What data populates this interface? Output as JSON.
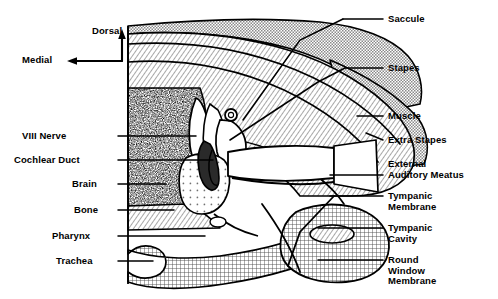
{
  "figure": {
    "background_color": "#ffffff",
    "ink_color": "#000000",
    "width": 498,
    "height": 299
  },
  "orientation": {
    "dorsal_label": "Dorsal",
    "medial_label": "Medial"
  },
  "labels_left": [
    {
      "text": "VIII Nerve",
      "x": 22,
      "y": 131,
      "line_x1": 118,
      "line_y1": 136,
      "line_x2": 196,
      "line_y2": 136
    },
    {
      "text": "Cochlear Duct",
      "x": 14,
      "y": 155,
      "line_x1": 118,
      "line_y1": 160,
      "line_x2": 213,
      "line_y2": 160
    },
    {
      "text": "Brain",
      "x": 72,
      "y": 179,
      "line_x1": 118,
      "line_y1": 184,
      "line_x2": 166,
      "line_y2": 184
    },
    {
      "text": "Bone",
      "x": 74,
      "y": 205,
      "line_x1": 118,
      "line_y1": 210,
      "line_x2": 174,
      "line_y2": 210
    },
    {
      "text": "Pharynx",
      "x": 52,
      "y": 231,
      "line_x1": 118,
      "line_y1": 236,
      "line_x2": 205,
      "line_y2": 236
    },
    {
      "text": "Trachea",
      "x": 56,
      "y": 256,
      "line_x1": 118,
      "line_y1": 261,
      "line_x2": 153,
      "line_y2": 261
    }
  ],
  "labels_right": [
    {
      "text": "Saccule",
      "x": 388,
      "y": 14,
      "line_x1": 383,
      "line_y1": 19,
      "line_x2": 343,
      "line_y2": 19,
      "leader": "M343,19 L300,40 L243,120"
    },
    {
      "text": "Stapes",
      "x": 388,
      "y": 63,
      "line_x1": 383,
      "line_y1": 68,
      "line_x2": 345,
      "line_y2": 68,
      "leader": "M345,68 L318,82 L230,140"
    },
    {
      "text": "Muscle",
      "x": 388,
      "y": 111,
      "line_x1": 383,
      "line_y1": 116,
      "line_x2": 357,
      "line_y2": 116,
      "leader": ""
    },
    {
      "text": "Extra Stapes",
      "x": 388,
      "y": 135,
      "line_x1": 383,
      "line_y1": 140,
      "line_x2": 366,
      "line_y2": 133,
      "leader": ""
    },
    {
      "text": "External\nAuditory Meatus",
      "x": 388,
      "y": 159,
      "line_x1": 383,
      "line_y1": 175,
      "line_x2": 330,
      "line_y2": 175,
      "leader": ""
    },
    {
      "text": "Tympanic\nMembrane",
      "x": 388,
      "y": 191,
      "line_x1": 383,
      "line_y1": 196,
      "line_x2": 330,
      "line_y2": 196,
      "leader": ""
    },
    {
      "text": "Tympanic\nCavity",
      "x": 388,
      "y": 223,
      "line_x1": 383,
      "line_y1": 228,
      "line_x2": 318,
      "line_y2": 228,
      "leader": ""
    },
    {
      "text": "Round\nWindow\nMembrane",
      "x": 388,
      "y": 255,
      "line_x1": 383,
      "line_y1": 260,
      "line_x2": 318,
      "line_y2": 260,
      "leader": ""
    }
  ],
  "regions": [
    {
      "name": "skull-roof-tissue",
      "fill": "checker"
    },
    {
      "name": "muscle-mass",
      "fill": "diagonal-hatch"
    },
    {
      "name": "brain",
      "fill": "stipple"
    },
    {
      "name": "cochlear-duct",
      "fill": "dotgrid"
    },
    {
      "name": "pharynx-trachea",
      "fill": "crosshatch"
    },
    {
      "name": "mandible",
      "fill": "crosshatch"
    },
    {
      "name": "stapes",
      "fill": "solid-dark"
    },
    {
      "name": "tympanic-cavity",
      "fill": "white"
    }
  ]
}
